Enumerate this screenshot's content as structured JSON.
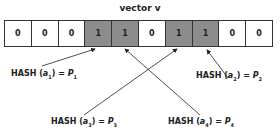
{
  "title": "vector v",
  "vector": [
    "0",
    "0",
    "0",
    "1",
    "1",
    "0",
    "1",
    "1",
    "0",
    "0"
  ],
  "labels": [
    {
      "fn": "HASH",
      "arg": "a",
      "arg_sub": "1",
      "eq": "=",
      "res": "P",
      "res_sub": "1"
    },
    {
      "fn": "HASH",
      "arg": "a",
      "arg_sub": "2",
      "eq": "=",
      "res": "P",
      "res_sub": "2"
    },
    {
      "fn": "HASH",
      "arg": "a",
      "arg_sub": "3",
      "eq": "=",
      "res": "P",
      "res_sub": "3"
    },
    {
      "fn": "HASH",
      "arg": "a",
      "arg_sub": "4",
      "eq": "=",
      "res": "P",
      "res_sub": "4"
    }
  ],
  "colors": {
    "set_bit": "#8c8c8c",
    "unset_bit": "#ffffff"
  }
}
